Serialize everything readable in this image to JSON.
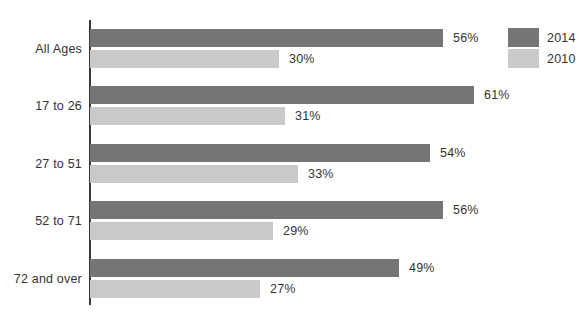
{
  "chart_data": {
    "type": "bar",
    "orientation": "horizontal",
    "title": "",
    "xlabel": "",
    "ylabel": "",
    "categories": [
      "All Ages",
      "17 to 26",
      "27 to 51",
      "52 to 71",
      "72 and over"
    ],
    "series": [
      {
        "name": "2014",
        "color": "#757575",
        "values": [
          56,
          61,
          54,
          56,
          49
        ],
        "labels": [
          "56%",
          "61%",
          "54%",
          "56%",
          "49%"
        ]
      },
      {
        "name": "2010",
        "color": "#c9c9c9",
        "values": [
          30,
          31,
          33,
          29,
          27
        ],
        "labels": [
          "30%",
          "31%",
          "33%",
          "29%",
          "27%"
        ]
      }
    ],
    "value_suffix": "%",
    "xlim": [
      0,
      63
    ],
    "grid": false,
    "legend_position": "top-right",
    "axis_color": "#383838",
    "text_color": "#333333",
    "background_color": "#ffffff"
  }
}
